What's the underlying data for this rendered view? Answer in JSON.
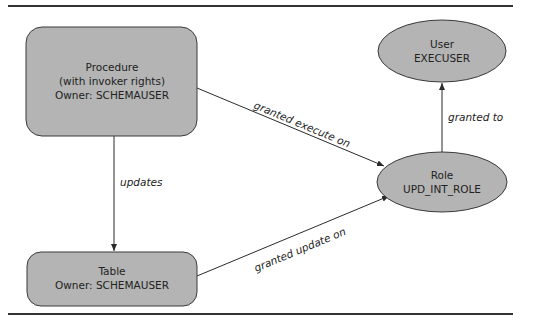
{
  "diagram": {
    "colors": {
      "node_fill": "#b4b4b4",
      "node_stroke": "#3a3a3a",
      "edge": "#2a2a2a",
      "rule": "#333333"
    },
    "nodes": {
      "procedure": {
        "shape": "rounded-rect",
        "lines": [
          "Procedure",
          "(with invoker rights)",
          "Owner: SCHEMAUSER"
        ]
      },
      "table": {
        "shape": "rounded-rect",
        "lines": [
          "Table",
          "Owner: SCHEMAUSER"
        ]
      },
      "user": {
        "shape": "ellipse",
        "lines": [
          "User",
          "EXECUSER"
        ]
      },
      "role": {
        "shape": "ellipse",
        "lines": [
          "Role",
          "UPD_INT_ROLE"
        ]
      }
    },
    "edges": [
      {
        "from": "procedure",
        "to": "role",
        "label": "granted execute on"
      },
      {
        "from": "procedure",
        "to": "table",
        "label": "updates"
      },
      {
        "from": "table",
        "to": "role",
        "label": "granted update on"
      },
      {
        "from": "role",
        "to": "user",
        "label": "granted to"
      }
    ]
  }
}
